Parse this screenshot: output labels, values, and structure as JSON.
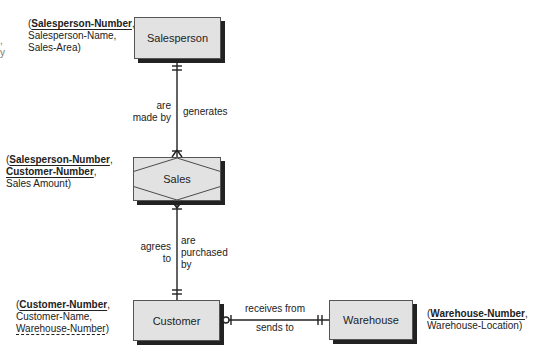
{
  "entities": {
    "salesperson": {
      "label": "Salesperson",
      "attributes": {
        "open": "(",
        "pk": "Salesperson-Number",
        "after_pk": ",",
        "line2": "Salesperson-Name,",
        "line3": "Sales-Area)"
      }
    },
    "sales": {
      "label": "Sales",
      "type": "associative",
      "attributes": {
        "open": "(",
        "pk1": "Salesperson-Number",
        "after_pk1": ",",
        "pk2": "Customer-Number",
        "after_pk2": ",",
        "line3": "Sales Amount)"
      }
    },
    "customer": {
      "label": "Customer",
      "attributes": {
        "open": "(",
        "pk": "Customer-Number",
        "after_pk": ",",
        "line2": "Customer-Name,",
        "fk": "Warehouse-Number",
        "close": ")"
      }
    },
    "warehouse": {
      "label": "Warehouse",
      "attributes": {
        "open": "(",
        "pk": "Warehouse-Number",
        "after_pk": ",",
        "line2": "Warehouse-Location)"
      }
    }
  },
  "relationships": [
    {
      "from": "Salesperson",
      "to": "Sales",
      "left_label": [
        "are",
        "made by"
      ],
      "right_label": "generates",
      "from_cardinality": "one-and-only-one",
      "to_cardinality": "one-or-many"
    },
    {
      "from": "Sales",
      "to": "Customer",
      "left_label": [
        "agrees",
        "to"
      ],
      "right_label": [
        "are",
        "purchased",
        "by"
      ],
      "from_cardinality": "one-or-many",
      "to_cardinality": "one-and-only-one"
    },
    {
      "from": "Customer",
      "to": "Warehouse",
      "top_label": "receives from",
      "bottom_label": "sends to",
      "from_cardinality": "zero-or-many",
      "to_cardinality": "one-and-only-one"
    }
  ],
  "edge_fragments": [
    ",",
    "y"
  ],
  "colors": {
    "entity_fill": "#e2e2e2",
    "entity_shadow": "#222222",
    "line": "#222222"
  }
}
